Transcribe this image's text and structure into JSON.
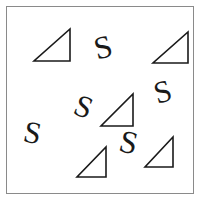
{
  "stimulus": {
    "title": "Visual search display",
    "description": "White square frame containing scattered rotated letter S distractors and right-triangle shapes",
    "width": 203,
    "height": 205,
    "background_color": "#ffffff",
    "frame": {
      "name": "search-frame",
      "x": 6,
      "y": 6,
      "width": 188,
      "height": 188,
      "border_color": "#8a8a8a",
      "border_width": 1,
      "fill_color": "#ffffff"
    },
    "ink_color": "#1a1a1a",
    "counts": {
      "triangles": 5,
      "letters_s": 5,
      "total_items": 10
    },
    "triangles": [
      {
        "id": "triangle-1",
        "label": "triangle",
        "x": 33,
        "y": 28,
        "width": 37,
        "height": 34,
        "rotation": 0,
        "right_angle_corner": "bottom-right"
      },
      {
        "id": "triangle-2",
        "label": "triangle",
        "x": 152,
        "y": 31,
        "width": 36,
        "height": 33,
        "rotation": 0,
        "right_angle_corner": "bottom-right"
      },
      {
        "id": "triangle-3",
        "label": "triangle",
        "x": 100,
        "y": 93,
        "width": 33,
        "height": 34,
        "rotation": 0,
        "right_angle_corner": "bottom-right"
      },
      {
        "id": "triangle-4",
        "label": "triangle",
        "x": 76,
        "y": 146,
        "width": 30,
        "height": 32,
        "rotation": 0,
        "right_angle_corner": "bottom-right"
      },
      {
        "id": "triangle-5",
        "label": "triangle",
        "x": 144,
        "y": 136,
        "width": 29,
        "height": 32,
        "rotation": 0,
        "right_angle_corner": "bottom-right"
      }
    ],
    "letters": [
      {
        "id": "letter-s-1",
        "glyph": "S",
        "x": 94,
        "y": 31,
        "font_size": 32,
        "rotation": -14
      },
      {
        "id": "letter-s-2",
        "glyph": "S",
        "x": 154,
        "y": 76,
        "font_size": 31,
        "rotation": -16
      },
      {
        "id": "letter-s-3",
        "glyph": "S",
        "x": 75,
        "y": 91,
        "font_size": 31,
        "rotation": 22
      },
      {
        "id": "letter-s-4",
        "glyph": "S",
        "x": 24,
        "y": 117,
        "font_size": 31,
        "rotation": 12
      },
      {
        "id": "letter-s-5",
        "glyph": "S",
        "x": 120,
        "y": 126,
        "font_size": 32,
        "rotation": 14
      }
    ]
  }
}
